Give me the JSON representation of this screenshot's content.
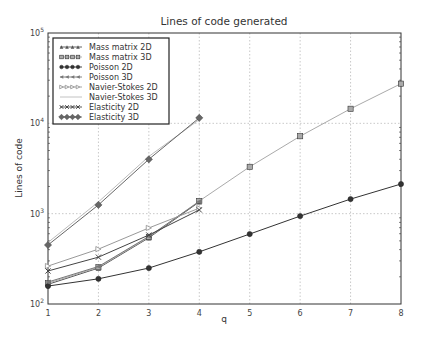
{
  "chart_data": {
    "type": "line",
    "title": "Lines of code generated",
    "xlabel": "q",
    "ylabel": "Lines of code",
    "yscale": "log",
    "xlim": [
      1,
      8
    ],
    "ylim": [
      100,
      100000
    ],
    "grid": true,
    "legend_position": "upper left",
    "x_ticks": [
      "1",
      "2",
      "3",
      "4",
      "5",
      "6",
      "7",
      "8"
    ],
    "y_ticks": [
      {
        "base": "10",
        "exp": "2",
        "value": 100
      },
      {
        "base": "10",
        "exp": "3",
        "value": 1000
      },
      {
        "base": "10",
        "exp": "4",
        "value": 10000
      },
      {
        "base": "10",
        "exp": "5",
        "value": 100000
      }
    ],
    "series": [
      {
        "name": "Mass matrix 2D",
        "marker": "triangle-up",
        "color": "#555555",
        "x": [
          1,
          2,
          3,
          4
        ],
        "values": [
          165,
          250,
          540,
          1350
        ]
      },
      {
        "name": "Mass matrix 3D",
        "marker": "square",
        "color": "#aaaaaa",
        "x": [
          1,
          2,
          3,
          4,
          5,
          6,
          7,
          8
        ],
        "values": [
          170,
          255,
          550,
          1380,
          3300,
          7200,
          14500,
          27500
        ]
      },
      {
        "name": "Poisson 2D",
        "marker": "circle",
        "color": "#333333",
        "x": [
          1,
          2,
          3,
          4,
          5,
          6,
          7,
          8
        ],
        "values": [
          158,
          190,
          250,
          378,
          595,
          940,
          1450,
          2130
        ]
      },
      {
        "name": "Poisson 3D",
        "marker": "triangle-left",
        "color": "#777777",
        "x": [
          1,
          2,
          3,
          4
        ],
        "values": [
          175,
          260,
          560,
          1360
        ]
      },
      {
        "name": "Navier-Stokes 2D",
        "marker": "triangle-right",
        "color": "#999999",
        "x": [
          1,
          2,
          3,
          4
        ],
        "values": [
          263,
          405,
          695,
          1150
        ]
      },
      {
        "name": "Navier-Stokes 3D",
        "marker": "none",
        "color": "#bbbbbb",
        "x": [
          1,
          2,
          3,
          4
        ],
        "values": [
          480,
          1350,
          4300,
          11000
        ]
      },
      {
        "name": "Elasticity 2D",
        "marker": "x",
        "color": "#444444",
        "x": [
          1,
          2,
          3,
          4
        ],
        "values": [
          232,
          330,
          580,
          1100
        ]
      },
      {
        "name": "Elasticity 3D",
        "marker": "diamond",
        "color": "#666666",
        "x": [
          1,
          2,
          3,
          4
        ],
        "values": [
          450,
          1250,
          4000,
          11500
        ]
      }
    ]
  }
}
